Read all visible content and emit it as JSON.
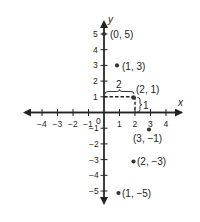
{
  "figure": {
    "type": "coordinate_plane",
    "axes": {
      "x_label": "x",
      "y_label": "y",
      "origin_label": "0"
    },
    "x_ticks": [
      -4,
      -3,
      -2,
      -1,
      1,
      2,
      3,
      4
    ],
    "y_ticks": [
      -5,
      -4,
      -3,
      -2,
      -1,
      1,
      2,
      3,
      4,
      5
    ],
    "x_tick_labels": [
      "−4",
      "−3",
      "−2",
      "−1",
      "1",
      "2",
      "3",
      "4"
    ],
    "y_tick_labels": [
      "−5",
      "−4",
      "−3",
      "−2",
      "−1",
      "1",
      "2",
      "3",
      "4",
      "5"
    ],
    "points": [
      {
        "x": 0,
        "y": 5,
        "label": "(0, 5)"
      },
      {
        "x": 1,
        "y": 3,
        "label": "(1, 3)"
      },
      {
        "x": 2,
        "y": 1,
        "label": "(2, 1)"
      },
      {
        "x": 3,
        "y": -1,
        "label": "(3, −1)"
      },
      {
        "x": 2,
        "y": -3,
        "label": "(2, −3)"
      },
      {
        "x": 1,
        "y": -5,
        "label": "(1, −5)"
      }
    ],
    "annotations": {
      "horizontal_run_label": "2",
      "vertical_rise_label": "1"
    },
    "colors": {
      "ink": "#222222",
      "background": "#ffffff"
    }
  }
}
